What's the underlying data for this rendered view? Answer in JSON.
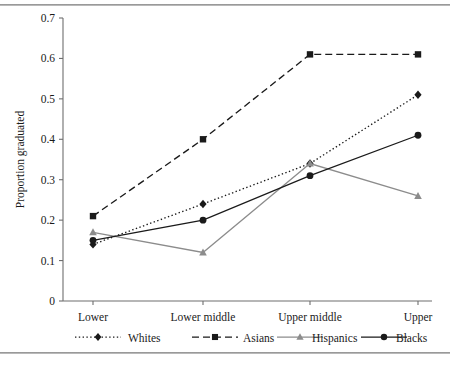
{
  "figure": {
    "caption_fragment": ""
  },
  "chart_data": {
    "type": "line",
    "title": "",
    "xlabel": "",
    "ylabel": "Proportion graduated",
    "categories": [
      "Lower",
      "Lower middle",
      "Upper middle",
      "Upper"
    ],
    "ylim": [
      0,
      0.7
    ],
    "yticks": [
      0,
      0.1,
      0.2,
      0.3,
      0.4,
      0.5,
      0.6,
      0.7
    ],
    "ytick_labels": [
      "0",
      "0.1",
      "0.2",
      "0.3",
      "0.4",
      "0.5",
      "0.6",
      "0.7"
    ],
    "grid": false,
    "legend_position": "bottom",
    "series": [
      {
        "name": "Whites",
        "values": [
          0.14,
          0.24,
          0.34,
          0.51
        ],
        "marker": "diamond",
        "line_style": "dotted",
        "color": "#1a1a1a"
      },
      {
        "name": "Asians",
        "values": [
          0.21,
          0.4,
          0.61,
          0.61
        ],
        "marker": "square",
        "line_style": "dashed",
        "color": "#1a1a1a"
      },
      {
        "name": "Hispanics",
        "values": [
          0.17,
          0.12,
          0.34,
          0.26
        ],
        "marker": "triangle",
        "line_style": "solid",
        "color": "#8c8c8c"
      },
      {
        "name": "Blacks",
        "values": [
          0.15,
          0.2,
          0.31,
          0.41
        ],
        "marker": "circle",
        "line_style": "solid",
        "color": "#1a1a1a"
      }
    ]
  }
}
